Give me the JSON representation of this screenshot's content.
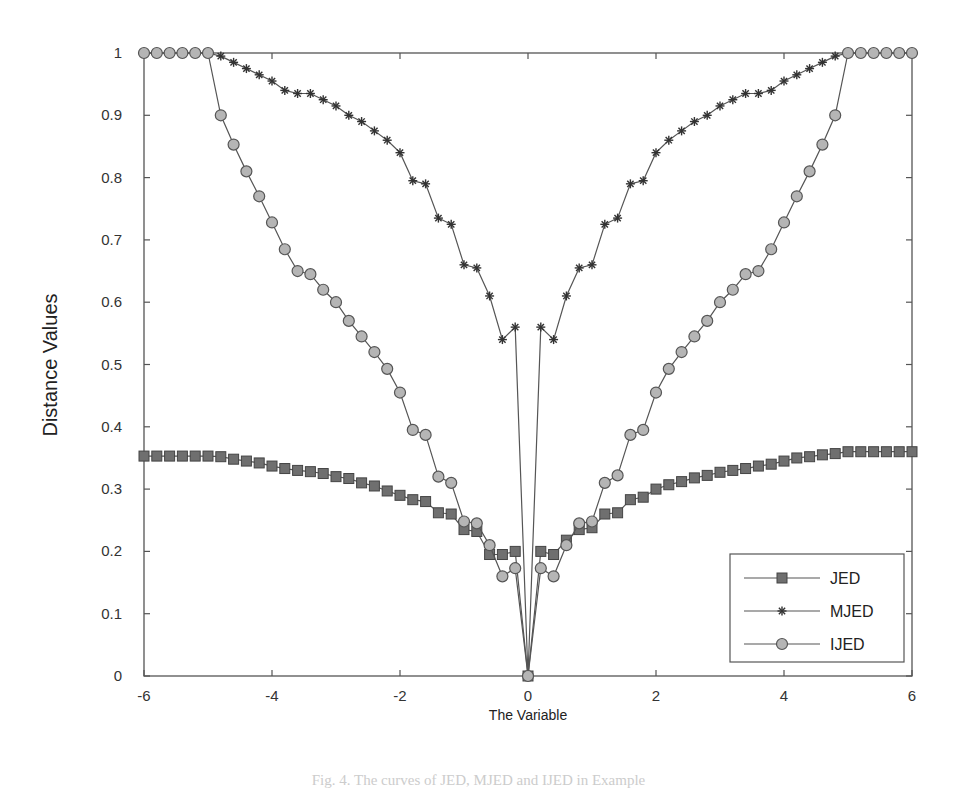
{
  "chart_data": {
    "type": "line",
    "title": "",
    "xlabel": "The Variable",
    "ylabel": "Distance Values",
    "xlim": [
      -6,
      6
    ],
    "ylim": [
      0,
      1
    ],
    "xticks": [
      -6,
      -4,
      -2,
      0,
      2,
      4,
      6
    ],
    "yticks": [
      0,
      0.1,
      0.2,
      0.3,
      0.4,
      0.5,
      0.6,
      0.7,
      0.8,
      0.9,
      1
    ],
    "xtick_labels": [
      "-6",
      "-4",
      "-2",
      "0",
      "2",
      "4",
      "6"
    ],
    "ytick_labels": [
      "0",
      "0.1",
      "0.2",
      "0.3",
      "0.4",
      "0.5",
      "0.6",
      "0.7",
      "0.8",
      "0.9",
      "1"
    ],
    "grid": false,
    "legend_position": "lower right",
    "x": [
      -6.0,
      -5.8,
      -5.6,
      -5.4,
      -5.2,
      -5.0,
      -4.8,
      -4.6,
      -4.4,
      -4.2,
      -4.0,
      -3.8,
      -3.6,
      -3.4,
      -3.2,
      -3.0,
      -2.8,
      -2.6,
      -2.4,
      -2.2,
      -2.0,
      -1.8,
      -1.6,
      -1.4,
      -1.2,
      -1.0,
      -0.8,
      -0.6,
      -0.4,
      -0.2,
      0.0,
      0.2,
      0.4,
      0.6,
      0.8,
      1.0,
      1.2,
      1.4,
      1.6,
      1.8,
      2.0,
      2.2,
      2.4,
      2.6,
      2.8,
      3.0,
      3.2,
      3.4,
      3.6,
      3.8,
      4.0,
      4.2,
      4.4,
      4.6,
      4.8,
      5.0,
      5.2,
      5.4,
      5.6,
      5.8,
      6.0
    ],
    "series": [
      {
        "name": "JED",
        "marker": "square",
        "values": [
          0.353,
          0.353,
          0.353,
          0.353,
          0.353,
          0.353,
          0.352,
          0.348,
          0.345,
          0.342,
          0.337,
          0.333,
          0.33,
          0.328,
          0.325,
          0.32,
          0.317,
          0.31,
          0.305,
          0.297,
          0.29,
          0.283,
          0.28,
          0.262,
          0.26,
          0.235,
          0.232,
          0.195,
          0.195,
          0.2,
          0.0,
          0.2,
          0.195,
          0.218,
          0.235,
          0.238,
          0.26,
          0.262,
          0.283,
          0.287,
          0.3,
          0.307,
          0.312,
          0.318,
          0.322,
          0.327,
          0.33,
          0.333,
          0.337,
          0.34,
          0.345,
          0.35,
          0.352,
          0.355,
          0.357,
          0.36,
          0.36,
          0.36,
          0.36,
          0.36,
          0.36
        ]
      },
      {
        "name": "MJED",
        "marker": "star",
        "values": [
          1.0,
          1.0,
          1.0,
          1.0,
          1.0,
          1.0,
          0.995,
          0.985,
          0.975,
          0.965,
          0.955,
          0.94,
          0.935,
          0.935,
          0.925,
          0.915,
          0.9,
          0.89,
          0.875,
          0.86,
          0.84,
          0.795,
          0.79,
          0.735,
          0.725,
          0.66,
          0.655,
          0.61,
          0.54,
          0.56,
          0.0,
          0.56,
          0.54,
          0.61,
          0.655,
          0.66,
          0.725,
          0.735,
          0.79,
          0.795,
          0.84,
          0.86,
          0.875,
          0.89,
          0.9,
          0.915,
          0.925,
          0.935,
          0.935,
          0.94,
          0.955,
          0.965,
          0.975,
          0.985,
          0.995,
          1.0,
          1.0,
          1.0,
          1.0,
          1.0,
          1.0
        ]
      },
      {
        "name": "IJED",
        "marker": "circle",
        "values": [
          1.0,
          1.0,
          1.0,
          1.0,
          1.0,
          1.0,
          0.9,
          0.853,
          0.81,
          0.77,
          0.728,
          0.685,
          0.65,
          0.645,
          0.62,
          0.6,
          0.57,
          0.545,
          0.52,
          0.493,
          0.455,
          0.395,
          0.387,
          0.32,
          0.31,
          0.248,
          0.245,
          0.21,
          0.16,
          0.173,
          0.0,
          0.173,
          0.16,
          0.21,
          0.245,
          0.248,
          0.31,
          0.322,
          0.387,
          0.395,
          0.455,
          0.493,
          0.52,
          0.545,
          0.57,
          0.6,
          0.62,
          0.645,
          0.65,
          0.685,
          0.728,
          0.77,
          0.81,
          0.853,
          0.9,
          1.0,
          1.0,
          1.0,
          1.0,
          1.0,
          1.0
        ]
      }
    ]
  },
  "legend": {
    "items": [
      {
        "label": "JED",
        "marker": "square"
      },
      {
        "label": "MJED",
        "marker": "star"
      },
      {
        "label": "IJED",
        "marker": "circle"
      }
    ]
  },
  "colors": {
    "line": "#555555",
    "square_fill": "#6f6f6f",
    "circle_fill": "#b5b5b5",
    "star": "#333333",
    "axis": "#555555"
  },
  "caption": "Fig. 4. The curves of JED, MJED and IJED in Example"
}
